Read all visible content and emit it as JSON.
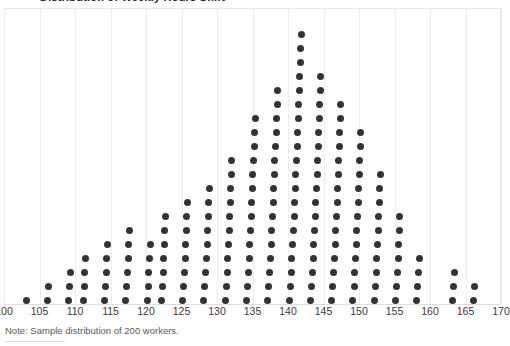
{
  "title": "Distribution of Weekly Hours Shift",
  "note": "Note: Sample distribution of 200 workers.",
  "colors": {
    "dot": "#333333",
    "gridline": "#ededed",
    "axis_label": "#3a3a3a",
    "note": "#5a5a5a",
    "background": "#ffffff"
  },
  "axis": {
    "ticks": [
      "100",
      "105",
      "110",
      "115",
      "120",
      "125",
      "130",
      "135",
      "140",
      "145",
      "150",
      "155",
      "160",
      "165",
      "170"
    ],
    "min": 100,
    "max": 170,
    "step": 5
  },
  "chart_data": {
    "type": "scatter",
    "title": "Distribution of Weekly Hours Shift",
    "subtitle": "",
    "xlabel": "",
    "ylabel": "",
    "xlim": [
      100,
      170
    ],
    "ylim": [
      0,
      21
    ],
    "grid": true,
    "legend": null,
    "annotations": [
      "Note: Sample distribution of 200 workers."
    ],
    "dot_value": 1,
    "total_dots": 200,
    "categories": [
      103,
      106,
      109,
      111,
      114,
      117,
      120,
      122,
      125,
      128,
      131,
      134,
      137,
      140,
      143,
      146,
      149,
      152,
      155,
      158,
      163,
      166
    ],
    "values": [
      1,
      2,
      3,
      4,
      5,
      6,
      5,
      7,
      8,
      9,
      11,
      14,
      16,
      20,
      17,
      15,
      13,
      10,
      7,
      4,
      3,
      2
    ]
  }
}
